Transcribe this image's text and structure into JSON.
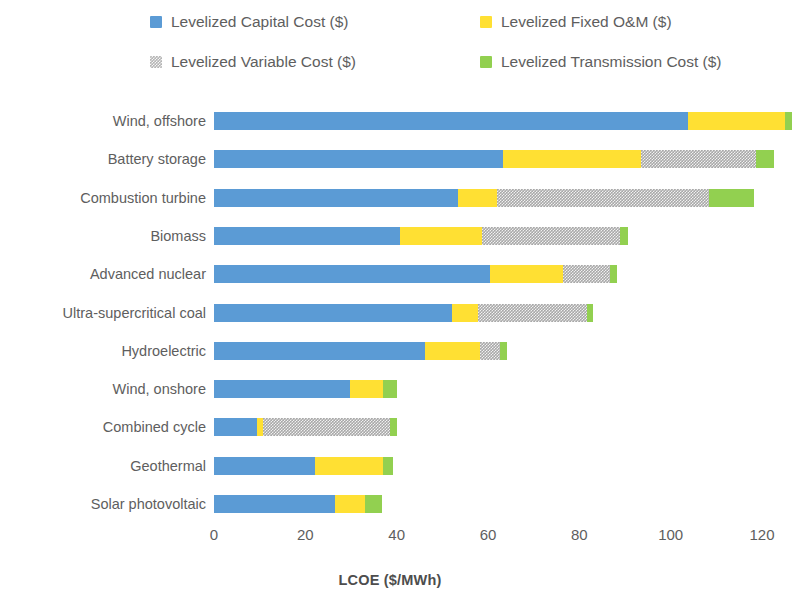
{
  "chart_data": {
    "type": "bar",
    "orientation": "horizontal",
    "stacked": true,
    "title": "",
    "xlabel": "LCOE ($/MWh)",
    "ylabel": "",
    "xlim": [
      0,
      128
    ],
    "xticks": [
      0,
      20,
      40,
      60,
      80,
      100,
      120
    ],
    "xtick_labels": [
      "0",
      "20",
      "40",
      "60",
      "80",
      "100",
      "120"
    ],
    "grid": false,
    "legend_position": "top",
    "categories": [
      "Wind, offshore",
      "Battery storage",
      "Combustion turbine",
      "Biomass",
      "Advanced nuclear",
      "Ultra-supercritical coal",
      "Hydroelectric",
      "Wind, onshore",
      "Combined cycle",
      "Geothermal",
      "Solar photovoltaic"
    ],
    "series": [
      {
        "name": "Levelized Capital Cost ($)",
        "color": "#5B9BD5",
        "key": "capital",
        "values": [
          103.7,
          63.3,
          53.5,
          40.7,
          60.4,
          52.1,
          46.2,
          29.8,
          9.4,
          22.1,
          26.5
        ]
      },
      {
        "name": "Levelized Fixed O&M ($)",
        "color": "#FFE033",
        "key": "fixed",
        "values": [
          21.3,
          30.1,
          8.5,
          18.0,
          16.0,
          5.7,
          12.0,
          7.2,
          1.4,
          14.9,
          6.6
        ]
      },
      {
        "name": "Levelized Variable Cost ($)",
        "color": "#A8A8A8",
        "key": "variable",
        "values": [
          0.0,
          25.2,
          46.4,
          30.2,
          10.3,
          23.9,
          4.4,
          0.0,
          27.7,
          0.0,
          0.0
        ]
      },
      {
        "name": "Levelized Transmission Cost ($)",
        "color": "#92D050",
        "key": "transmission",
        "values": [
          1.5,
          4.0,
          9.8,
          1.8,
          1.6,
          1.3,
          1.6,
          3.0,
          1.5,
          2.2,
          3.7
        ]
      }
    ],
    "totals": [
      126.5,
      122.6,
      118.2,
      90.7,
      88.3,
      83.0,
      64.2,
      40.0,
      40.0,
      39.2,
      36.8
    ]
  },
  "legend": {
    "items": [
      {
        "label": "Levelized Capital Cost ($)",
        "swatch": "capital"
      },
      {
        "label": "Levelized Fixed O&M ($)",
        "swatch": "fixed"
      },
      {
        "label": "Levelized Variable Cost ($)",
        "swatch": "variable"
      },
      {
        "label": "Levelized Transmission Cost ($)",
        "swatch": "transmission"
      }
    ]
  }
}
